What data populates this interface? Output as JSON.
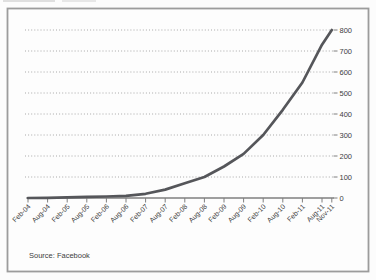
{
  "figure": {
    "source_note": "Source: Facebook"
  },
  "chart_data": {
    "type": "line",
    "title": "",
    "xlabel": "",
    "ylabel": "",
    "x_labels": [
      "Feb-04",
      "Aug-04",
      "Feb-05",
      "Aug-05",
      "Feb-06",
      "Aug-06",
      "Feb-07",
      "Aug-07",
      "Feb-08",
      "Aug-08",
      "Feb-09",
      "Aug-09",
      "Feb-10",
      "Aug-10",
      "Feb-11",
      "Aug-11",
      "Nov-11"
    ],
    "values": [
      0,
      1,
      3,
      5,
      7,
      10,
      20,
      40,
      70,
      100,
      150,
      210,
      300,
      420,
      550,
      730,
      800
    ],
    "y_ticks": [
      0,
      100,
      200,
      300,
      400,
      500,
      600,
      700,
      800
    ],
    "ylim": [
      0,
      800
    ],
    "y_axis_side": "right",
    "grid": "horizontal-dotted",
    "legend": "none"
  },
  "colors": {
    "line": "#55565a",
    "grid": "#a9a9a9",
    "axis": "#7f7f7f",
    "border": "#9c9c9c",
    "text": "#3d3d3d",
    "background": "#fcfcfc",
    "plot_background": "#fdfdfd"
  }
}
